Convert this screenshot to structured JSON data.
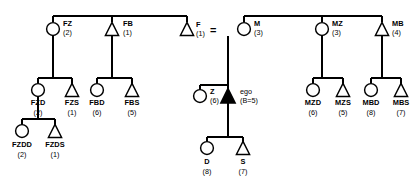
{
  "diagram": {
    "marriage_symbol": "=",
    "ego_label": "ego",
    "ego_birth_order": "(B=5)",
    "colors": {
      "line": "#000000",
      "text": "#000000",
      "ego_fill": "#000000",
      "background": "#ffffff"
    },
    "symbols": {
      "female": "circle",
      "male": "triangle",
      "ego": "filled-triangle"
    },
    "persons": [
      {
        "id": "FZ",
        "label": "FZ",
        "number": "(2)",
        "sex": "female",
        "x": 53,
        "y": 29,
        "gen": 1
      },
      {
        "id": "FB",
        "label": "FB",
        "number": "(1)",
        "sex": "male",
        "x": 112,
        "y": 29,
        "gen": 1
      },
      {
        "id": "F",
        "label": "F",
        "number": "(1)",
        "sex": "male",
        "x": 187,
        "y": 29,
        "gen": 1
      },
      {
        "id": "M",
        "label": "M",
        "number": "(3)",
        "sex": "female",
        "x": 244,
        "y": 29,
        "gen": 1
      },
      {
        "id": "MZ",
        "label": "MZ",
        "number": "(3)",
        "sex": "female",
        "x": 322,
        "y": 29,
        "gen": 1
      },
      {
        "id": "MB",
        "label": "MB",
        "number": "(4)",
        "sex": "male",
        "x": 382,
        "y": 29,
        "gen": 1
      },
      {
        "id": "FZD",
        "label": "FZD",
        "number": "(2)",
        "sex": "female",
        "x": 38,
        "y": 90,
        "gen": 2
      },
      {
        "id": "FZS",
        "label": "FZS",
        "number": "(1)",
        "sex": "male",
        "x": 72,
        "y": 90,
        "gen": 2
      },
      {
        "id": "FBD",
        "label": "FBD",
        "number": "(6)",
        "sex": "female",
        "x": 97,
        "y": 90,
        "gen": 2
      },
      {
        "id": "FBS",
        "label": "FBS",
        "number": "(5)",
        "sex": "male",
        "x": 132,
        "y": 90,
        "gen": 2
      },
      {
        "id": "Z",
        "label": "Z",
        "number": "(6)",
        "sex": "female",
        "x": 200,
        "y": 96,
        "gen": 2
      },
      {
        "id": "EGO",
        "label": "ego",
        "number": "(B=5)",
        "sex": "ego",
        "x": 228,
        "y": 96,
        "gen": 2
      },
      {
        "id": "MZD",
        "label": "MZD",
        "number": "(6)",
        "sex": "female",
        "x": 313,
        "y": 90,
        "gen": 2
      },
      {
        "id": "MZS",
        "label": "MZS",
        "number": "(5)",
        "sex": "male",
        "x": 343,
        "y": 90,
        "gen": 2
      },
      {
        "id": "MBD",
        "label": "MBD",
        "number": "(8)",
        "sex": "female",
        "x": 371,
        "y": 90,
        "gen": 2
      },
      {
        "id": "MBS",
        "label": "MBS",
        "number": "(7)",
        "sex": "male",
        "x": 401,
        "y": 90,
        "gen": 2
      },
      {
        "id": "FZDD",
        "label": "FZDD",
        "number": "(2)",
        "sex": "female",
        "x": 22,
        "y": 131,
        "gen": 3
      },
      {
        "id": "FZDS",
        "label": "FZDS",
        "number": "(1)",
        "sex": "male",
        "x": 55,
        "y": 131,
        "gen": 3
      },
      {
        "id": "D",
        "label": "D",
        "number": "(8)",
        "sex": "female",
        "x": 207,
        "y": 148,
        "gen": 3
      },
      {
        "id": "S",
        "label": "S",
        "number": "(7)",
        "sex": "male",
        "x": 243,
        "y": 148,
        "gen": 3
      }
    ]
  }
}
